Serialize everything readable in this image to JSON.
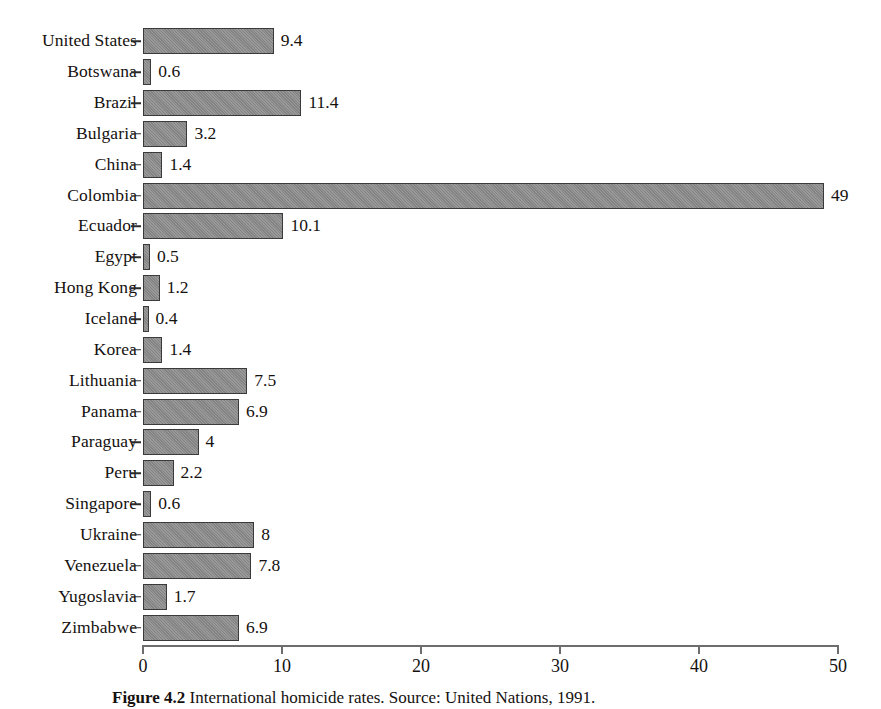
{
  "chart_data": {
    "type": "bar",
    "orientation": "horizontal",
    "title": "",
    "xlabel": "",
    "ylabel": "",
    "xlim": [
      0,
      50
    ],
    "xticks": [
      0,
      10,
      20,
      30,
      40,
      50
    ],
    "xtick_labels": [
      "0",
      "10",
      "20",
      "30",
      "40",
      "50"
    ],
    "grid": false,
    "legend": null,
    "bar_color": "#8d8d8d",
    "bar_border_color": "#3a3a3a",
    "categories": [
      "United States",
      "Botswana",
      "Brazil",
      "Bulgaria",
      "China",
      "Colombia",
      "Ecuador",
      "Egypt",
      "Hong Kong",
      "Iceland",
      "Korea",
      "Lithuania",
      "Panama",
      "Paraguay",
      "Peru",
      "Singapore",
      "Ukraine",
      "Venezuela",
      "Yugoslavia",
      "Zimbabwe"
    ],
    "values": [
      9.4,
      0.6,
      11.4,
      3.2,
      1.4,
      49,
      10.1,
      0.5,
      1.2,
      0.4,
      1.4,
      7.5,
      6.9,
      4,
      2.2,
      0.6,
      8,
      7.8,
      1.7,
      6.9
    ],
    "value_labels": [
      "9.4",
      "0.6",
      "11.4",
      "3.2",
      "1.4",
      "49",
      "10.1",
      "0.5",
      "1.2",
      "0.4",
      "1.4",
      "7.5",
      "6.9",
      "4",
      "2.2",
      "0.6",
      "8",
      "7.8",
      "1.7",
      "6.9"
    ]
  },
  "caption": {
    "number": "Figure 4.2",
    "text": "International homicide rates. Source: United Nations, 1991."
  }
}
